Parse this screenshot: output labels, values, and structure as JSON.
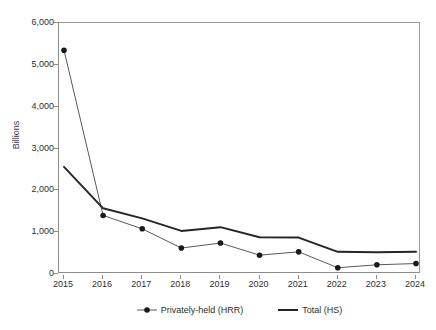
{
  "chart_data": {
    "type": "line",
    "title": "",
    "subtitle": "",
    "xlabel": "",
    "ylabel": "Billions",
    "categories": [
      "2015",
      "2016",
      "2017",
      "2018",
      "2019",
      "2020",
      "2021",
      "2022",
      "2023",
      "2024"
    ],
    "x": [
      2015,
      2016,
      2017,
      2018,
      2019,
      2020,
      2021,
      2022,
      2023,
      2024
    ],
    "ylim": [
      0,
      6000
    ],
    "ytick_values": [
      0,
      1000,
      2000,
      3000,
      4000,
      5000,
      6000
    ],
    "ytick_labels": [
      "0",
      "1,000",
      "2,000",
      "3,000",
      "4,000",
      "5,000",
      "6,000"
    ],
    "grid": false,
    "legend_position": "bottom",
    "series": [
      {
        "name": "Privately-held (HRR)",
        "marker": "filled-circle",
        "line_width": 1,
        "color": "#595959",
        "values": [
          5350,
          1400,
          1080,
          620,
          740,
          450,
          530,
          150,
          220,
          250
        ]
      },
      {
        "name": "Total (HS)",
        "marker": "none",
        "line_width": 2,
        "color": "#262626",
        "values": [
          2560,
          1570,
          1330,
          1030,
          1120,
          880,
          870,
          530,
          520,
          530
        ]
      }
    ]
  },
  "legend": {
    "items": [
      {
        "label": "Privately-held (HRR)",
        "marker": "filled-circle",
        "color": "#595959"
      },
      {
        "label": "Total (HS)",
        "marker": "none",
        "color": "#262626"
      }
    ]
  },
  "axes": {
    "y_title": "Billions"
  }
}
